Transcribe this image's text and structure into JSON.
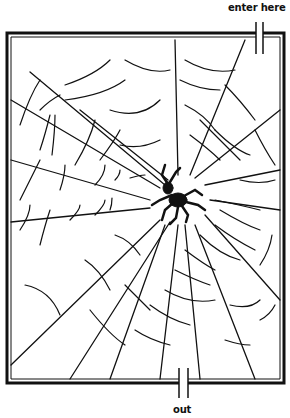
{
  "puzzle": {
    "type": "maze",
    "theme": "spider web",
    "entrance_label": "enter here",
    "exit_label": "out"
  },
  "colors": {
    "ink": "#111111",
    "background": "#ffffff"
  },
  "frame": {
    "x": 7,
    "y": 33,
    "width": 277,
    "height": 350
  },
  "spider": {
    "cx": 175,
    "cy": 190
  }
}
